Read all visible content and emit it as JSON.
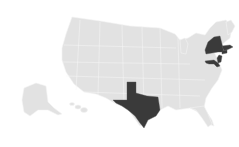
{
  "map": {
    "type": "us-state-choropleth",
    "base_color": "#e2e2e2",
    "highlight_color": "#3a3a3a",
    "highlighted_states": [
      "Texas",
      "New York",
      "Massachusetts",
      "Connecticut",
      "New Jersey",
      "Maryland",
      "Delaware"
    ],
    "other_regions": [
      "Alaska",
      "Hawaii"
    ]
  }
}
